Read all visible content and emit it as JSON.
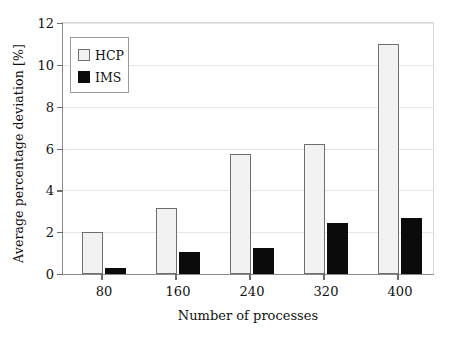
{
  "chart_data": {
    "type": "bar",
    "title": "",
    "xlabel": "Number of processes",
    "ylabel": "Average percentage deviation [%]",
    "categories": [
      "80",
      "160",
      "240",
      "320",
      "400"
    ],
    "series": [
      {
        "name": "HCP",
        "color": "#f2f2f2",
        "edge_color": "#6e6e6e",
        "values": [
          2.0,
          3.15,
          5.75,
          6.2,
          11.0
        ]
      },
      {
        "name": "IMS",
        "color": "#0b0b0b",
        "edge_color": "#0b0b0b",
        "values": [
          0.3,
          1.05,
          1.25,
          2.45,
          2.7
        ]
      }
    ],
    "ylim": [
      0,
      12
    ],
    "yticks": [
      "0",
      "2",
      "4",
      "6",
      "8",
      "10",
      "12"
    ],
    "ytick_values": [
      0,
      2,
      4,
      6,
      8,
      10,
      12
    ],
    "grid": true,
    "grid_axis": "y",
    "legend_position": "upper-left",
    "legend_entries": [
      "HCP",
      "IMS"
    ]
  }
}
